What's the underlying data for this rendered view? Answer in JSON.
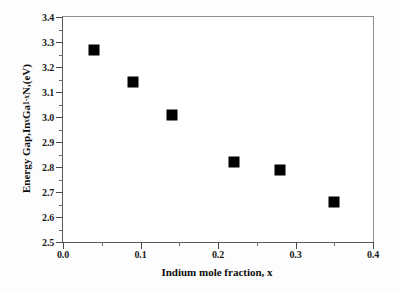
{
  "chart_data": {
    "type": "scatter",
    "title": "",
    "xlabel": "Indium mole fraction, x",
    "ylabel_plain": "Energy Gap,InxGa1-xN,(eV)",
    "xlim": [
      0.0,
      0.4
    ],
    "ylim": [
      2.5,
      3.4
    ],
    "grid": false,
    "legend": "none",
    "marker_style": "filled-square",
    "marker_color": "#000000",
    "xticks": [
      0.0,
      0.1,
      0.2,
      0.3,
      0.4
    ],
    "xtick_labels": [
      "0.0",
      "0.1",
      "0.2",
      "0.3",
      "0.4"
    ],
    "xminor_ticks": [
      0.05,
      0.15,
      0.25,
      0.35
    ],
    "yticks": [
      2.5,
      2.6,
      2.7,
      2.8,
      2.9,
      3.0,
      3.1,
      3.2,
      3.3,
      3.4
    ],
    "ytick_labels": [
      "2.5",
      "2.6",
      "2.7",
      "2.8",
      "2.9",
      "3.0",
      "3.1",
      "3.2",
      "3.3",
      "3.4"
    ],
    "yminor_ticks": [
      2.55,
      2.65,
      2.75,
      2.85,
      2.95,
      3.05,
      3.15,
      3.25,
      3.35
    ],
    "x": [
      0.04,
      0.09,
      0.14,
      0.22,
      0.28,
      0.35
    ],
    "y": [
      3.27,
      3.14,
      3.01,
      2.82,
      2.79,
      2.66
    ],
    "points": [
      {
        "x": 0.04,
        "y": 3.27
      },
      {
        "x": 0.09,
        "y": 3.14
      },
      {
        "x": 0.14,
        "y": 3.01
      },
      {
        "x": 0.22,
        "y": 2.82
      },
      {
        "x": 0.28,
        "y": 2.79
      },
      {
        "x": 0.35,
        "y": 2.66
      }
    ]
  },
  "axis_labels": {
    "y_prefix": "Energy Gap,In",
    "y_sub1": "x",
    "y_mid": "Ga",
    "y_sub2": "1-x",
    "y_suffix": "N,(eV)"
  }
}
